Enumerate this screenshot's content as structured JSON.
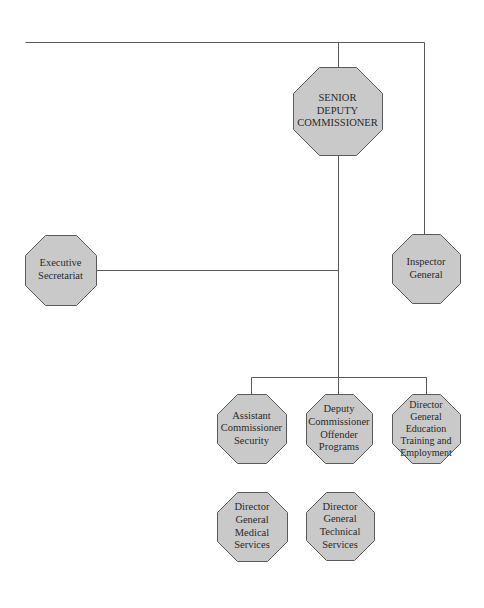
{
  "diagram": {
    "type": "org-chart",
    "colors": {
      "node_fill": "#c9c9c9",
      "node_border": "#5a5a5a",
      "line": "#5a5a5a",
      "text": "#2a2a2a",
      "background": "#ffffff"
    },
    "nodes": [
      {
        "id": "senior",
        "lines": [
          "SENIOR",
          "DEPUTY",
          "COMMISSIONER"
        ],
        "x": 293,
        "y": 67,
        "w": 89,
        "h": 88,
        "font": 10.5
      },
      {
        "id": "executive",
        "lines": [
          "Executive",
          "Secretariat"
        ],
        "x": 25,
        "y": 235,
        "w": 71,
        "h": 70,
        "font": 10.5
      },
      {
        "id": "inspector",
        "lines": [
          "Inspector",
          "General"
        ],
        "x": 392,
        "y": 234,
        "w": 68,
        "h": 69,
        "font": 10.5
      },
      {
        "id": "assistant",
        "lines": [
          "Assistant",
          "Commissioner",
          "Security"
        ],
        "x": 217,
        "y": 394,
        "w": 69,
        "h": 69,
        "font": 10.5
      },
      {
        "id": "deputy",
        "lines": [
          "Deputy",
          "Commissioner",
          "Offender",
          "Programs"
        ],
        "x": 306,
        "y": 394,
        "w": 66,
        "h": 69,
        "font": 10.5
      },
      {
        "id": "education",
        "lines": [
          "Director",
          "General",
          "Education",
          "Training and",
          "Employment"
        ],
        "x": 392,
        "y": 394,
        "w": 68,
        "h": 69,
        "font": 10
      },
      {
        "id": "medical",
        "lines": [
          "Director",
          "General",
          "Medical",
          "Services"
        ],
        "x": 217,
        "y": 492,
        "w": 70,
        "h": 69,
        "font": 10.5
      },
      {
        "id": "technical",
        "lines": [
          "Director",
          "General",
          "Technical",
          "Services"
        ],
        "x": 306,
        "y": 492,
        "w": 68,
        "h": 68,
        "font": 10.5
      }
    ],
    "connectors": [
      [
        [
          25,
          42
        ],
        [
          424,
          42
        ]
      ],
      [
        [
          338,
          42
        ],
        [
          338,
          67
        ]
      ],
      [
        [
          424,
          42
        ],
        [
          424,
          234
        ]
      ],
      [
        [
          338,
          155
        ],
        [
          338,
          394
        ]
      ],
      [
        [
          96,
          270
        ],
        [
          338,
          270
        ]
      ],
      [
        [
          251,
          377
        ],
        [
          426,
          377
        ]
      ],
      [
        [
          251,
          377
        ],
        [
          251,
          394
        ]
      ],
      [
        [
          426,
          377
        ],
        [
          426,
          394
        ]
      ]
    ]
  }
}
